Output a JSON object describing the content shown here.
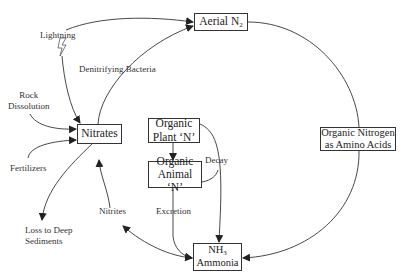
{
  "diagram": {
    "nodes": {
      "aerial_n2": {
        "label": "Aerial N",
        "sub": "2"
      },
      "nitrates": {
        "label": "Nitrates"
      },
      "plant": {
        "line1": "Organic",
        "line2": "Plant ‘N’"
      },
      "animal": {
        "line1": "Organic",
        "line2": "Animal ‘N’"
      },
      "organic_nitrogen": {
        "line1": "Organic Nitrogen",
        "line2": "as Amino Acids"
      },
      "ammonia": {
        "line1": "NH",
        "sub": "3",
        "line2": "Ammonia"
      }
    },
    "labels": {
      "lightning": "Lightning",
      "denitrifying": "Denitrifying Bacteria",
      "rock1": "Rock",
      "rock2": "Dissolution",
      "fertilizers": "Fertilizers",
      "loss1": "Loss to Deep",
      "loss2": "Sediments",
      "nitrites": "Nitrites",
      "decay": "Decay",
      "excretion": "Excretion"
    },
    "edges": [
      {
        "from": "Lightning",
        "to": "Aerial N2"
      },
      {
        "from": "Lightning",
        "to": "Nitrates"
      },
      {
        "from": "Nitrates",
        "to": "Aerial N2",
        "label": "Denitrifying Bacteria"
      },
      {
        "from": "Rock Dissolution",
        "to": "Nitrates"
      },
      {
        "from": "Fertilizers",
        "to": "Nitrates"
      },
      {
        "from": "Nitrates",
        "to": "Loss to Deep Sediments"
      },
      {
        "from": "Ammonia",
        "to": "Nitrates",
        "label": "Nitrites",
        "bidirectional": true
      },
      {
        "from": "Organic Plant N",
        "to": "Organic Animal N"
      },
      {
        "from": "Organic Plant N",
        "to": "Ammonia",
        "label": "Decay"
      },
      {
        "from": "Organic Animal N",
        "to": "Ammonia",
        "label": "Decay"
      },
      {
        "from": "Organic Animal N",
        "to": "Ammonia",
        "label": "Excretion"
      },
      {
        "from": "Aerial N2",
        "to": "Organic Nitrogen as Amino Acids"
      },
      {
        "from": "Organic Nitrogen as Amino Acids",
        "to": "Ammonia"
      }
    ]
  }
}
